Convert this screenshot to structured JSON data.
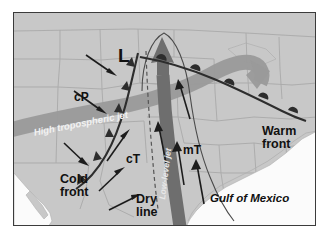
{
  "figure": {
    "background_color": "#ffffff",
    "border_color": "#3b3b3b"
  },
  "map": {
    "land_color": "#c8c8c8",
    "water_color": "#fbfbfb",
    "state_border_color": "#a8a8a8",
    "width": 303,
    "height": 214
  },
  "labels": {
    "low_pressure": "L",
    "air_mass_cP": "cP",
    "air_mass_cT": "cT",
    "air_mass_mT": "mT",
    "cold_front_line1": "Cold",
    "cold_front_line2": "front",
    "warm_front_line1": "Warm",
    "warm_front_line2": "front",
    "dry_line_line1": "Dry",
    "dry_line_line2": "line",
    "high_jet": "High tropospheric jet",
    "low_jet": "Low-level jet",
    "gulf": "Gulf of Mexico"
  },
  "features": [
    {
      "name": "high-tropospheric-jet",
      "label": "High tropospheric jet",
      "kind": "jet-stream-band",
      "color": "#9a9a9a",
      "description": "Broad gray ribbon entering from west-southwest, arcing northeast over the low and curving back east with a large arrowhead"
    },
    {
      "name": "low-level-jet",
      "label": "Low-level jet",
      "kind": "jet-stream-band",
      "color": "#6e6e6e",
      "description": "Dark vertical ribbon from the Gulf of Mexico northward to the low, ending in a large arrowhead"
    },
    {
      "name": "cold-front",
      "label": "Cold front",
      "kind": "front",
      "symbol": "filled-triangles",
      "color": "#2d2d2d",
      "description": "Curved boundary trailing southwest from the low with solid triangle pips"
    },
    {
      "name": "warm-front",
      "label": "Warm front",
      "kind": "front",
      "symbol": "filled-semicircles",
      "color": "#2d2d2d",
      "description": "Curved boundary trailing east-southeast from the low with solid semicircle pips"
    },
    {
      "name": "dry-line",
      "label": "Dry line",
      "kind": "boundary",
      "symbol": "dashed",
      "color": "#555555",
      "description": "Thin dashed line running north-south ahead of the cold front"
    },
    {
      "name": "trough-axis",
      "kind": "boundary",
      "symbol": "thin-curve",
      "color": "#4a4a4a",
      "description": "Thin curved line arcing over the top of the low-level jet arrowhead"
    }
  ],
  "air_masses": [
    {
      "code": "cP",
      "name": "continental Polar",
      "flow_direction": "southeast"
    },
    {
      "code": "cT",
      "name": "continental Tropical",
      "flow_direction": "northeast"
    },
    {
      "code": "mT",
      "name": "maritime Tropical",
      "flow_direction": "north"
    }
  ],
  "flow_arrows": [
    {
      "region": "cP",
      "from": [
        72,
        42
      ],
      "to": [
        100,
        62
      ]
    },
    {
      "region": "cP",
      "from": [
        60,
        78
      ],
      "to": [
        92,
        100
      ]
    },
    {
      "region": "cP",
      "from": [
        50,
        130
      ],
      "to": [
        73,
        152
      ]
    },
    {
      "region": "cT",
      "from": [
        93,
        148
      ],
      "to": [
        115,
        118
      ]
    },
    {
      "region": "cT",
      "from": [
        85,
        178
      ],
      "to": [
        110,
        155
      ]
    },
    {
      "region": "cT",
      "from": [
        95,
        196
      ],
      "to": [
        125,
        182
      ]
    },
    {
      "region": "mT",
      "from": [
        152,
        150
      ],
      "to": [
        143,
        110
      ]
    },
    {
      "region": "mT",
      "from": [
        170,
        172
      ],
      "to": [
        163,
        130
      ]
    },
    {
      "region": "mT",
      "from": [
        190,
        190
      ],
      "to": [
        182,
        148
      ]
    },
    {
      "region": "mT",
      "from": [
        175,
        105
      ],
      "to": [
        160,
        68
      ]
    }
  ]
}
